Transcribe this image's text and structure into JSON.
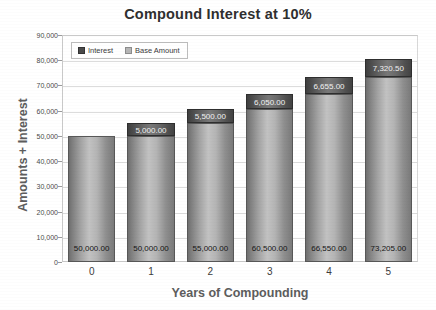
{
  "chart_data": {
    "type": "bar",
    "subtype": "stacked-column",
    "title": "Compound Interest at 10%",
    "xlabel": "Years of Compounding",
    "ylabel": "Amounts + Interest",
    "categories": [
      "0",
      "1",
      "2",
      "3",
      "4",
      "5"
    ],
    "series": [
      {
        "name": "Base Amount",
        "values": [
          50000,
          50000,
          55000,
          60500,
          66550,
          73205
        ],
        "labels": [
          "50,000.00",
          "50,000.00",
          "55,000.00",
          "60,500.00",
          "66,550.00",
          "73,205.00"
        ],
        "color": "#b4b4b4"
      },
      {
        "name": "Interest",
        "values": [
          0,
          5000,
          5500,
          6050,
          6655,
          7320.5
        ],
        "labels": [
          "",
          "5,000.00",
          "5,500.00",
          "6,050.00",
          "6,655.00",
          "7,320.50"
        ],
        "color": "#4a4a4a"
      }
    ],
    "ylim": [
      0,
      90000
    ],
    "ytick_labels": [
      "90,000",
      "80,000",
      "70,000",
      "60,000",
      "50,000",
      "40,000",
      "30,000",
      "20,000",
      "10,000",
      "0"
    ],
    "ytick_values": [
      90000,
      80000,
      70000,
      60000,
      50000,
      40000,
      30000,
      20000,
      10000,
      0
    ],
    "grid": true,
    "legend_position": "top-left-inside",
    "legend_entries": [
      "Interest",
      "Base Amount"
    ]
  }
}
